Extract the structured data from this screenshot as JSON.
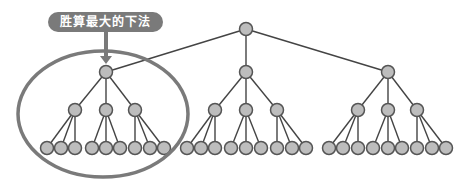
{
  "callout": {
    "label": "胜算最大的下法"
  },
  "colors": {
    "node_fill": "#bdbdbd",
    "node_stroke": "#555555",
    "edge": "#444444",
    "highlight": "#7a7a7a",
    "callout_bg": "#7a7a7a",
    "callout_text": "#ffffff"
  },
  "tree": {
    "root": {
      "x": 246,
      "y": 29
    },
    "level1": [
      {
        "x": 106,
        "y": 72
      },
      {
        "x": 246,
        "y": 72
      },
      {
        "x": 388,
        "y": 72
      }
    ],
    "level2": [
      {
        "x": 75,
        "y": 110,
        "parent": 0
      },
      {
        "x": 106,
        "y": 110,
        "parent": 0
      },
      {
        "x": 135,
        "y": 110,
        "parent": 0
      },
      {
        "x": 215,
        "y": 110,
        "parent": 1
      },
      {
        "x": 246,
        "y": 110,
        "parent": 1
      },
      {
        "x": 277,
        "y": 110,
        "parent": 1
      },
      {
        "x": 358,
        "y": 110,
        "parent": 2
      },
      {
        "x": 388,
        "y": 110,
        "parent": 2
      },
      {
        "x": 417,
        "y": 110,
        "parent": 2
      }
    ],
    "leaf_y": 148,
    "leaves": [
      {
        "x": 47,
        "parent": 0
      },
      {
        "x": 61,
        "parent": 0
      },
      {
        "x": 75,
        "parent": 0
      },
      {
        "x": 92,
        "parent": 1
      },
      {
        "x": 106,
        "parent": 1
      },
      {
        "x": 120,
        "parent": 1
      },
      {
        "x": 135,
        "parent": 2
      },
      {
        "x": 150,
        "parent": 2
      },
      {
        "x": 164,
        "parent": 2
      },
      {
        "x": 187,
        "parent": 3
      },
      {
        "x": 201,
        "parent": 3
      },
      {
        "x": 215,
        "parent": 3
      },
      {
        "x": 231,
        "parent": 4
      },
      {
        "x": 246,
        "parent": 4
      },
      {
        "x": 261,
        "parent": 4
      },
      {
        "x": 277,
        "parent": 5
      },
      {
        "x": 292,
        "parent": 5
      },
      {
        "x": 306,
        "parent": 5
      },
      {
        "x": 329,
        "parent": 6
      },
      {
        "x": 343,
        "parent": 6
      },
      {
        "x": 358,
        "parent": 6
      },
      {
        "x": 373,
        "parent": 7
      },
      {
        "x": 388,
        "parent": 7
      },
      {
        "x": 402,
        "parent": 7
      },
      {
        "x": 417,
        "parent": 8
      },
      {
        "x": 432,
        "parent": 8
      },
      {
        "x": 446,
        "parent": 8
      }
    ],
    "node_radius": 6.5,
    "highlight_ellipse": {
      "cx": 103,
      "cy": 114,
      "rx": 85,
      "ry": 63
    }
  },
  "arrow": {
    "x": 106,
    "y1": 32,
    "y2": 64
  }
}
